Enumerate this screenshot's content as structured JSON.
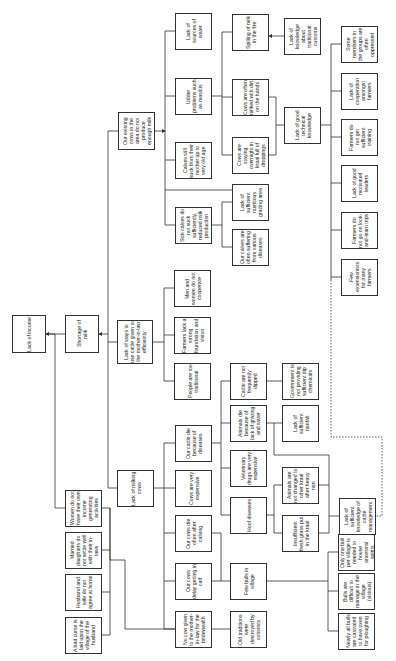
{
  "diagram": {
    "type": "problem-tree",
    "orientation": "rotated-90-ccw",
    "colors": {
      "line": "#333333",
      "box_border": "#333333",
      "background": "#ffffff",
      "text": "#222222"
    },
    "nodes": [
      {
        "id": "n1",
        "label": "Lack of income",
        "x": 12,
        "y": 315,
        "w": 34,
        "h": 38
      },
      {
        "id": "n2",
        "label": "Shortage of milk",
        "x": 65,
        "y": 315,
        "w": 34,
        "h": 38
      },
      {
        "id": "n3",
        "label": "Lack of ways to use cattle given to the mother-in-law efficiently",
        "x": 117,
        "y": 320,
        "w": 36,
        "h": 44
      },
      {
        "id": "n4",
        "label": "Our existing cows in the area do not produce enough milk",
        "x": 118,
        "y": 112,
        "w": 37,
        "h": 38
      },
      {
        "id": "n5",
        "label": "Lack of sources of water",
        "x": 175,
        "y": 13,
        "w": 37,
        "h": 37
      },
      {
        "id": "n6",
        "label": "Udder problems such as mastitis",
        "x": 175,
        "y": 78,
        "w": 37,
        "h": 37
      },
      {
        "id": "n7",
        "label": "Calves still suck from their mother up to very old age",
        "x": 175,
        "y": 142,
        "w": 37,
        "h": 37
      },
      {
        "id": "n8",
        "label": "Sick calves do not suck sufficiently, reduced milk production",
        "x": 175,
        "y": 207,
        "w": 37,
        "h": 37
      },
      {
        "id": "n9",
        "label": "Spilling of milk in the fire",
        "x": 232,
        "y": 14,
        "w": 37,
        "h": 37
      },
      {
        "id": "n10",
        "label": "Cows are often milked with dirt on the hands",
        "x": 232,
        "y": 79,
        "w": 37,
        "h": 37
      },
      {
        "id": "n11",
        "label": "Cows are staying overnight in kraal full of droppings",
        "x": 232,
        "y": 137,
        "w": 37,
        "h": 37
      },
      {
        "id": "n12",
        "label": "Lack of sufficient nutritious grazing area",
        "x": 232,
        "y": 184,
        "w": 37,
        "h": 37
      },
      {
        "id": "n13",
        "label": "Our calves are often suffering from various diseases",
        "x": 232,
        "y": 229,
        "w": 37,
        "h": 37
      },
      {
        "id": "n14",
        "label": "Lack of knowledge about traditional customs",
        "x": 284,
        "y": 18,
        "w": 37,
        "h": 37
      },
      {
        "id": "n15",
        "label": "Lack of good technical knowledge",
        "x": 284,
        "y": 107,
        "w": 37,
        "h": 37
      },
      {
        "id": "n16",
        "label": "Some members in the groups are often oppressed",
        "x": 341,
        "y": 26,
        "w": 37,
        "h": 37
      },
      {
        "id": "n17",
        "label": "Lack of cooperation amongst farmers",
        "x": 341,
        "y": 73,
        "w": 37,
        "h": 37
      },
      {
        "id": "n18",
        "label": "Farmers do not get sufficient training",
        "x": 341,
        "y": 119,
        "w": 37,
        "h": 37
      },
      {
        "id": "n19",
        "label": "Lack of good motivated leaders",
        "x": 341,
        "y": 165,
        "w": 37,
        "h": 37
      },
      {
        "id": "n20",
        "label": "Farmers do not go on look-and-learn trips",
        "x": 341,
        "y": 212,
        "w": 37,
        "h": 37
      },
      {
        "id": "n21",
        "label": "Few extensionists for many farmers",
        "x": 341,
        "y": 259,
        "w": 37,
        "h": 37
      },
      {
        "id": "n22",
        "label": "Men and women do not cooperate",
        "x": 174,
        "y": 270,
        "w": 37,
        "h": 37
      },
      {
        "id": "n23",
        "label": "Farmers lack a strong foundation and vision",
        "x": 174,
        "y": 317,
        "w": 37,
        "h": 37
      },
      {
        "id": "n24",
        "label": "People are too traditional",
        "x": 174,
        "y": 363,
        "w": 37,
        "h": 37
      },
      {
        "id": "n25",
        "label": "Cattle are not frequently dipped",
        "x": 230,
        "y": 363,
        "w": 37,
        "h": 37
      },
      {
        "id": "n26",
        "label": "Government is not providing sufficient dip chemicals",
        "x": 282,
        "y": 363,
        "w": 37,
        "h": 37
      },
      {
        "id": "n27",
        "label": "Lack of milking cows",
        "x": 117,
        "y": 470,
        "w": 37,
        "h": 37
      },
      {
        "id": "n28",
        "label": "Our cattle die because of diseases",
        "x": 175,
        "y": 425,
        "w": 37,
        "h": 37
      },
      {
        "id": "n29",
        "label": "Animals die because of lack of grazing and water",
        "x": 230,
        "y": 405,
        "w": 37,
        "h": 37
      },
      {
        "id": "n30",
        "label": "Lack of sufficient rainfall",
        "x": 282,
        "y": 405,
        "w": 37,
        "h": 37
      },
      {
        "id": "n31",
        "label": "Cows are very expensive",
        "x": 175,
        "y": 470,
        "w": 37,
        "h": 37
      },
      {
        "id": "n32",
        "label": "Veterinary drugs are very expensive",
        "x": 230,
        "y": 450,
        "w": 37,
        "h": 37
      },
      {
        "id": "n33",
        "label": "Hoof diseases",
        "x": 230,
        "y": 497,
        "w": 37,
        "h": 37
      },
      {
        "id": "n34",
        "label": "Animals are not changed to other kraal after heavy rain",
        "x": 282,
        "y": 467,
        "w": 37,
        "h": 37
      },
      {
        "id": "n35",
        "label": "Insufficient fresh grass put in the kraal",
        "x": 282,
        "y": 515,
        "w": 37,
        "h": 37
      },
      {
        "id": "n36",
        "label": "Lack of sufficient knowledge of cattle management",
        "x": 339,
        "y": 498,
        "w": 37,
        "h": 37
      },
      {
        "id": "n37",
        "label": "Our cows die often after calving",
        "x": 175,
        "y": 515,
        "w": 37,
        "h": 37
      },
      {
        "id": "n38",
        "label": "Our cows delay getting in calf",
        "x": 175,
        "y": 563,
        "w": 37,
        "h": 37
      },
      {
        "id": "n39",
        "label": "No cow given to the mother-in-law for the bridewealth",
        "x": 175,
        "y": 611,
        "w": 37,
        "h": 37
      },
      {
        "id": "n40",
        "label": "Few bulls in village",
        "x": 230,
        "y": 563,
        "w": 37,
        "h": 37
      },
      {
        "id": "n41",
        "label": "Old traditions were destroyed by colonists",
        "x": 230,
        "y": 611,
        "w": 37,
        "h": 37
      },
      {
        "id": "n42",
        "label": "Only one bull per village is needed to house ancestral spirits",
        "x": 338,
        "y": 534,
        "w": 37,
        "h": 37
      },
      {
        "id": "n43",
        "label": "Bulls are difficult to manage in the village (vicious)",
        "x": 338,
        "y": 573,
        "w": 37,
        "h": 37
      },
      {
        "id": "n44",
        "label": "Nearly all bulls are castrated to have oxen for ploughing",
        "x": 338,
        "y": 613,
        "w": 37,
        "h": 37
      },
      {
        "id": "n45",
        "label": "Women do not have their own income generating activities",
        "x": 65,
        "y": 490,
        "w": 37,
        "h": 37
      },
      {
        "id": "n46",
        "label": "Married daughters do not settle well with their in-laws",
        "x": 65,
        "y": 532,
        "w": 37,
        "h": 37
      },
      {
        "id": "n47",
        "label": "Husband and wife do not agree at home",
        "x": 65,
        "y": 574,
        "w": 37,
        "h": 37
      },
      {
        "id": "n48",
        "label": "A bad curse is laid upon the village of the husband",
        "x": 65,
        "y": 617,
        "w": 37,
        "h": 37
      }
    ]
  }
}
